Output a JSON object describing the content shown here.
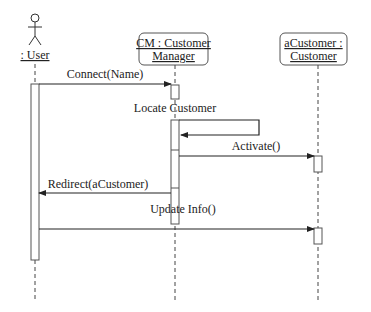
{
  "diagram": {
    "type": "uml-sequence",
    "lifelines": [
      {
        "id": "user",
        "label": ": User",
        "kind": "actor"
      },
      {
        "id": "cm",
        "label_line1": "CM : Customer",
        "label_line2": "Manager",
        "kind": "object"
      },
      {
        "id": "acust",
        "label_line1": "aCustomer :",
        "label_line2": "Customer",
        "kind": "object"
      }
    ],
    "messages": [
      {
        "from": "user",
        "to": "cm",
        "label": "Connect(Name)"
      },
      {
        "from": "cm",
        "to": "cm",
        "label": "Locate Customer"
      },
      {
        "from": "cm",
        "to": "acust",
        "label": "Activate()"
      },
      {
        "from": "cm",
        "to": "user",
        "label": "Redirect(aCustomer)"
      },
      {
        "from": "user",
        "to": "acust",
        "label": "Update Info()"
      }
    ]
  }
}
